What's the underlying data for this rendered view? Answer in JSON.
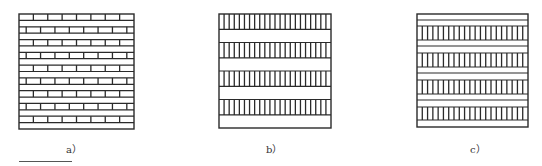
{
  "figure": {
    "stroke_color": "#2a2a2a",
    "panels": [
      {
        "id": "a",
        "label": "a）",
        "description": "Running bond brick pattern: rows of bricks alternating with plain horizontal courses",
        "box": {
          "x": 19,
          "y": 14,
          "w": 115,
          "h": 115
        },
        "pattern": "brick",
        "brick_rows": 9,
        "bricks_per_row": 8,
        "label_pos": {
          "x": 66,
          "y": 142
        }
      },
      {
        "id": "b",
        "label": "b）",
        "description": "Alternating bands of vertical stripes (headers) and plain stretcher courses",
        "box": {
          "x": 219,
          "y": 14,
          "w": 112,
          "h": 114
        },
        "pattern": "stripe-band",
        "bands": 4,
        "stripes_per_band": 22,
        "label_pos": {
          "x": 266,
          "y": 142
        }
      },
      {
        "id": "c",
        "label": "c）",
        "description": "Two plain courses followed by one band of vertical stripes, repeated",
        "box": {
          "x": 417,
          "y": 14,
          "w": 111,
          "h": 113
        },
        "pattern": "double-course-stripe",
        "bands": 4,
        "stripes_per_band": 21,
        "label_pos": {
          "x": 470,
          "y": 142
        }
      }
    ]
  }
}
